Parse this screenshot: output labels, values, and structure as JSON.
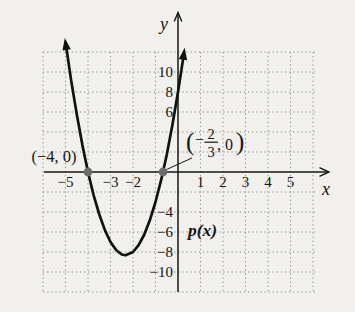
{
  "figure": {
    "background": "#f1f0ec",
    "y_axis_label": "y",
    "x_axis_label": "x",
    "function_label": "p(x)",
    "left_point_label": "(−4, 0)",
    "right_point_label": {
      "open_paren": "(",
      "minus": "−",
      "numerator": "2",
      "denominator": "3",
      "comma_zero": ", 0",
      "close_paren": ")"
    }
  },
  "chart_data": {
    "type": "line",
    "title": "",
    "xlabel": "x",
    "ylabel": "y",
    "xlim": [
      -6.2,
      6.8
    ],
    "ylim": [
      -12.6,
      14
    ],
    "grid": "dotted",
    "grid_color": "#908f88",
    "curve_color": "#121212",
    "point_color": "#6b6b6b",
    "x_gridlines": [
      -6,
      -5,
      -4,
      -3,
      -2,
      -1,
      1,
      2,
      3,
      4,
      5,
      6
    ],
    "y_gridlines": [
      -12,
      -10,
      -8,
      -6,
      -4,
      -2,
      2,
      4,
      6,
      8,
      10,
      12
    ],
    "x_ticks": [
      {
        "v": -5,
        "label": "−5"
      },
      {
        "v": -3,
        "label": "−3"
      },
      {
        "v": -2,
        "label": "−2"
      },
      {
        "v": 1,
        "label": "1"
      },
      {
        "v": 2,
        "label": "2"
      },
      {
        "v": 3,
        "label": "3"
      },
      {
        "v": 4,
        "label": "4"
      },
      {
        "v": 5,
        "label": "5"
      }
    ],
    "y_ticks": [
      {
        "v": 10,
        "label": "10"
      },
      {
        "v": 8,
        "label": "8"
      },
      {
        "v": 6,
        "label": "6"
      },
      {
        "v": -4,
        "label": "−4"
      },
      {
        "v": -6,
        "label": "−6"
      },
      {
        "v": -8,
        "label": "−8"
      },
      {
        "v": -10,
        "label": "−10"
      }
    ],
    "marked_points": [
      {
        "x": -4,
        "y": 0,
        "label": "(−4, 0)"
      },
      {
        "x": -0.6667,
        "y": 0,
        "label": "(−2/3, 0)"
      }
    ],
    "vertex_estimate": {
      "x": -2.33,
      "y": -8.33
    },
    "series": [
      {
        "name": "p(x)",
        "points": [
          [
            -4.97,
            12.52
          ],
          [
            -4.75,
            9.19
          ],
          [
            -4.5,
            5.75
          ],
          [
            -4.25,
            2.69
          ],
          [
            -4,
            0
          ],
          [
            -3.75,
            -2.31
          ],
          [
            -3.5,
            -4.25
          ],
          [
            -3.25,
            -5.81
          ],
          [
            -3,
            -7
          ],
          [
            -2.75,
            -7.81
          ],
          [
            -2.5,
            -8.25
          ],
          [
            -2.33,
            -8.33
          ],
          [
            -2,
            -8
          ],
          [
            -1.75,
            -7.31
          ],
          [
            -1.5,
            -6.25
          ],
          [
            -1.25,
            -4.81
          ],
          [
            -1,
            -3
          ],
          [
            -0.75,
            -0.81
          ],
          [
            -0.667,
            0
          ],
          [
            -0.5,
            1.75
          ],
          [
            -0.25,
            4.69
          ],
          [
            0,
            8
          ],
          [
            0.2,
            10.92
          ],
          [
            0.24,
            11.53
          ]
        ]
      }
    ]
  }
}
